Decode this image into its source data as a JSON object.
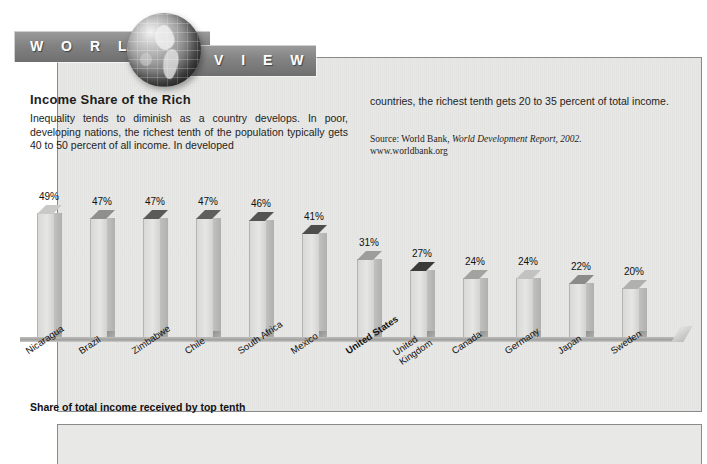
{
  "banner": {
    "word_left": "W O R L D",
    "word_right": "V I E W",
    "globe_icon": "globe-icon"
  },
  "article": {
    "headline": "Income Share of the Rich",
    "body_left": "Inequality tends to diminish as a country develops. In poor, developing nations, the richest tenth of the population typically gets 40 to 50 percent of all income. In developed",
    "body_right": "countries, the richest tenth gets 20 to 35 percent of total income.",
    "source_prefix": "Source: World Bank, ",
    "source_italic": "World Development Report, 2002.",
    "source_url": "www.worldbank.org"
  },
  "caption": "Share of total income received by top tenth",
  "colors": {
    "banner_band": "#828282",
    "paper": "#e8e8e6",
    "border": "#8a8a8a",
    "text": "#1e1e1e",
    "bar_front": "#e6e6e4"
  },
  "chart_data": {
    "type": "bar",
    "title": "Income Share of the Rich",
    "xlabel": "",
    "ylabel": "Share of total income received by top tenth",
    "ylim": [
      0,
      50
    ],
    "grid": false,
    "legend": "none",
    "value_suffix": "%",
    "categories": [
      "Nicaragua",
      "Brazil",
      "Zimbabwe",
      "Chile",
      "South Africa",
      "Mexico",
      "United States",
      "United Kingdom",
      "Canada",
      "Germany",
      "Japan",
      "Sweden"
    ],
    "values": [
      49,
      47,
      47,
      47,
      46,
      41,
      31,
      27,
      24,
      24,
      22,
      20
    ],
    "labels": [
      "49%",
      "47%",
      "47%",
      "47%",
      "46%",
      "41%",
      "31%",
      "27%",
      "24%",
      "24%",
      "22%",
      "20%"
    ],
    "highlight": "United States",
    "bar_top_shades": [
      "#c9c9c7",
      "#8f8f8d",
      "#5a5a58",
      "#5f5f5d",
      "#545452",
      "#4e4e4c",
      "#9d9d9b",
      "#3a3a38",
      "#a2a2a0",
      "#c2c2c0",
      "#8b8b89",
      "#b0b0ae"
    ]
  }
}
